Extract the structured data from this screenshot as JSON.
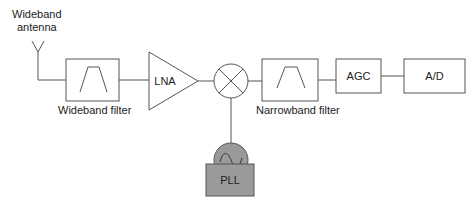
{
  "diagram": {
    "type": "block-diagram",
    "labels": {
      "antenna": [
        "Wideband",
        "antenna"
      ],
      "wideband_filter": "Wideband filter",
      "lna": "LNA",
      "narrowband_filter": "Narrowband filter",
      "agc": "AGC",
      "ad": "A/D",
      "pll": "PLL"
    },
    "nodes": [
      {
        "id": "antenna",
        "label": "Wideband antenna",
        "shape": "antenna"
      },
      {
        "id": "wideband_filter",
        "label": "Wideband filter",
        "shape": "box-bandpass"
      },
      {
        "id": "lna",
        "label": "LNA",
        "shape": "triangle"
      },
      {
        "id": "mixer",
        "label": "",
        "shape": "circle-x"
      },
      {
        "id": "narrowband_filter",
        "label": "Narrowband filter",
        "shape": "box-bandpass"
      },
      {
        "id": "agc",
        "label": "AGC",
        "shape": "box"
      },
      {
        "id": "ad",
        "label": "A/D",
        "shape": "box"
      },
      {
        "id": "oscillator",
        "label": "",
        "shape": "circle-sine"
      },
      {
        "id": "pll",
        "label": "PLL",
        "shape": "box-filled"
      }
    ],
    "edges": [
      [
        "antenna",
        "wideband_filter"
      ],
      [
        "wideband_filter",
        "lna"
      ],
      [
        "lna",
        "mixer"
      ],
      [
        "mixer",
        "narrowband_filter"
      ],
      [
        "narrowband_filter",
        "agc"
      ],
      [
        "agc",
        "ad"
      ],
      [
        "oscillator",
        "mixer"
      ],
      [
        "pll",
        "oscillator"
      ]
    ],
    "colors": {
      "line": "#555555",
      "fill_gray": "#9a9a9a",
      "background": "#ffffff"
    }
  }
}
